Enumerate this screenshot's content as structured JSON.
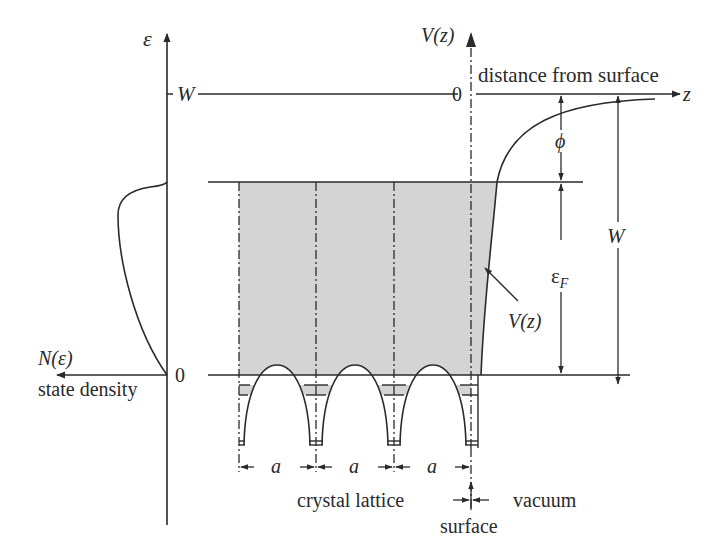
{
  "diagram": {
    "colors": {
      "ink": "#2a2a2a",
      "fill": "#d4d4d4",
      "background": "#ffffff"
    },
    "labels": {
      "energy_axis": "ε",
      "potential_axis": "V(z)",
      "distance_label": "distance from surface",
      "z_axis": "z",
      "w_level": "W",
      "zero_top": "0",
      "zero_bottom": "0",
      "phi": "ϕ",
      "w_arrow": "W",
      "fermi_main": "ε",
      "fermi_sub": "F",
      "potential_curve": "V(z)",
      "state_density_symbol": "N(ε)",
      "state_density": "state density",
      "lattice_spacing": [
        "a",
        "a",
        "a"
      ],
      "crystal_lattice": "crystal lattice",
      "vacuum": "vacuum",
      "surface": "surface"
    }
  }
}
